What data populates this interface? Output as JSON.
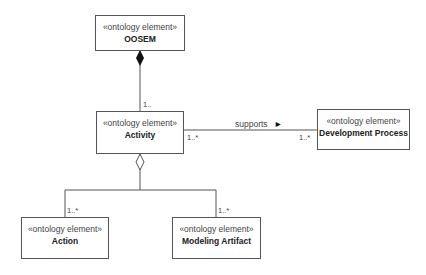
{
  "elements": {
    "oosem": {
      "stereotype": "«ontology element»",
      "name": "OOSEM"
    },
    "activity": {
      "stereotype": "«ontology element»",
      "name": "Activity"
    },
    "development_process": {
      "stereotype": "«ontology element»",
      "name": "Development Process"
    },
    "action": {
      "stereotype": "«ontology element»",
      "name": "Action"
    },
    "modeling_artifact": {
      "stereotype": "«ontology element»",
      "name": "Modeling Artifact"
    }
  },
  "relations": {
    "composition": {
      "from": "OOSEM",
      "to": "Activity",
      "multiplicity": "1.."
    },
    "supports": {
      "label": "supports",
      "direction_glyph": "►",
      "source_multiplicity": "1..*",
      "target_multiplicity": "1..*"
    },
    "aggregation": {
      "from": "Activity",
      "action_multiplicity": "1..*",
      "artifact_multiplicity": "1..*"
    }
  }
}
